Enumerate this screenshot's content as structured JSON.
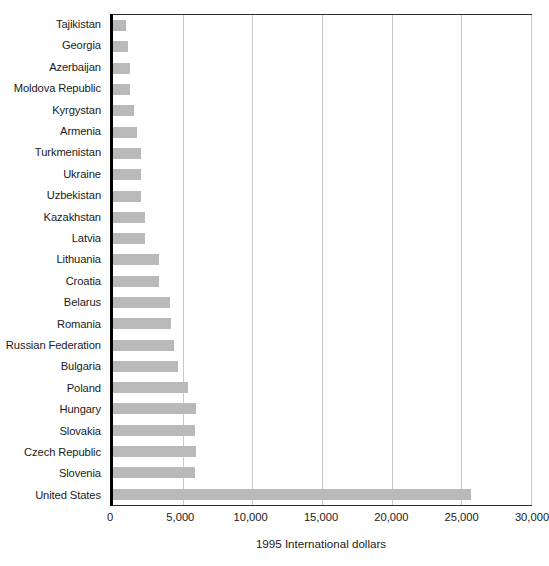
{
  "chart_data": {
    "type": "bar",
    "orientation": "horizontal",
    "title": "",
    "xlabel": "1995 International dollars",
    "ylabel": "",
    "xlim": [
      0,
      30000
    ],
    "xticks": [
      0,
      5000,
      10000,
      15000,
      20000,
      25000,
      30000
    ],
    "xtick_labels": [
      "0",
      "5,000",
      "10,000",
      "15,000",
      "20,000",
      "25,000",
      "30,000"
    ],
    "grid": "vertical",
    "legend": "none",
    "bar_color": "#b9b9b9",
    "axis_color": "#000000",
    "gridline_color": "#c9c9c9",
    "categories": [
      "Tajikistan",
      "Georgia",
      "Azerbaijan",
      "Moldova Republic",
      "Kyrgystan",
      "Armenia",
      "Turkmenistan",
      "Ukraine",
      "Uzbekistan",
      "Kazakhstan",
      "Latvia",
      "Lithuania",
      "Croatia",
      "Belarus",
      "Romania",
      "Russian Federation",
      "Bulgaria",
      "Poland",
      "Hungary",
      "Slovakia",
      "Czech Republic",
      "Slovenia",
      "United States"
    ],
    "values": [
      950,
      1050,
      1200,
      1200,
      1500,
      1700,
      2000,
      2000,
      2000,
      2300,
      2300,
      3300,
      3300,
      4100,
      4150,
      4350,
      4650,
      5400,
      5950,
      5850,
      5950,
      5850,
      25700
    ]
  }
}
